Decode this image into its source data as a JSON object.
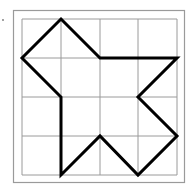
{
  "figure": {
    "grid": {
      "rows": 4,
      "cols": 4,
      "origin_px": [
        22,
        19
      ],
      "x_lines_px": [
        22,
        61,
        100,
        138,
        177
      ],
      "y_lines_px": [
        19,
        58,
        97,
        136,
        175
      ],
      "line_color": "#9a9a9a"
    },
    "frame": {
      "x": 13,
      "y": 10,
      "width": 171,
      "height": 172,
      "color": "#9a9a9a"
    },
    "marker_dot": {
      "x": 3,
      "y": 20,
      "color": "#777777"
    },
    "polygon": {
      "stroke_color": "#000000",
      "stroke_width": 3,
      "vertices_grid": [
        [
          1,
          0
        ],
        [
          2,
          1
        ],
        [
          4,
          1
        ],
        [
          3,
          2
        ],
        [
          4,
          3
        ],
        [
          3,
          4
        ],
        [
          2,
          3
        ],
        [
          1,
          4
        ],
        [
          1,
          2
        ],
        [
          0,
          1
        ]
      ],
      "points_px": "61,19 100,58 177,58 138,97 177,136 138,175 100,136 61,175 61,97 22,58"
    }
  }
}
